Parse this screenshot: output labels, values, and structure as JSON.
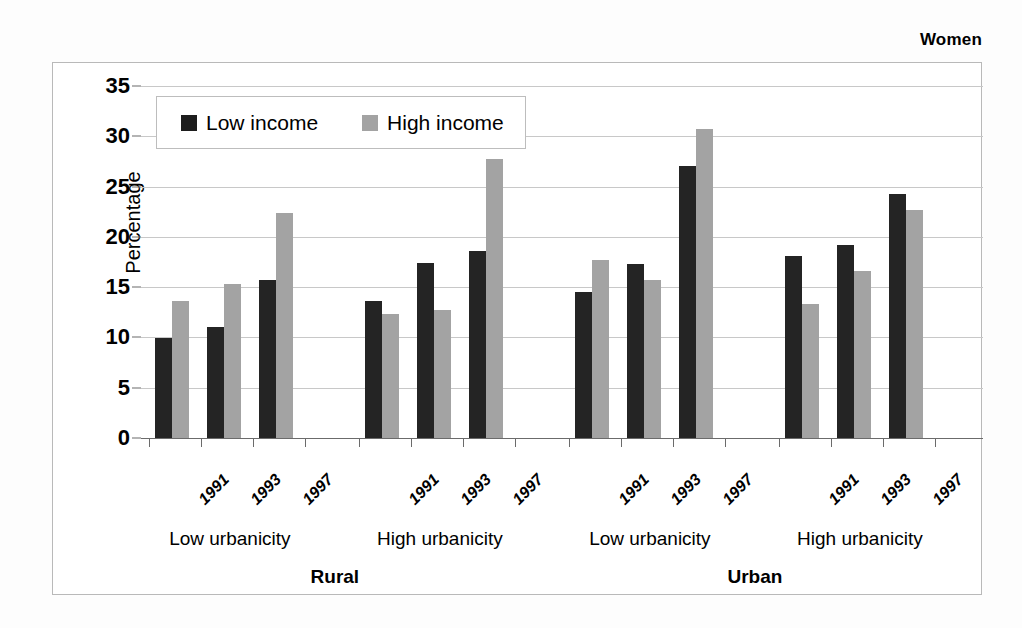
{
  "title": "Women",
  "legend": {
    "items": [
      {
        "label": "Low income",
        "key": "low",
        "color": "#1d1d1d"
      },
      {
        "label": "High income",
        "key": "high",
        "color": "#a3a3a3"
      }
    ]
  },
  "axis": {
    "y_title": "Percentage",
    "y_ticks": [
      "0",
      "5",
      "10",
      "15",
      "20",
      "25",
      "30",
      "35"
    ]
  },
  "groups": [
    {
      "region": "Rural",
      "urbanicity": "Low urbanicity",
      "years": [
        "1991",
        "1993",
        "1997"
      ]
    },
    {
      "region": "Rural",
      "urbanicity": "High urbanicity",
      "years": [
        "1991",
        "1993",
        "1997"
      ]
    },
    {
      "region": "Urban",
      "urbanicity": "Low urbanicity",
      "years": [
        "1991",
        "1993",
        "1997"
      ]
    },
    {
      "region": "Urban",
      "urbanicity": "High urbanicity",
      "years": [
        "1991",
        "1993",
        "1997"
      ]
    }
  ],
  "regions": [
    {
      "label": "Rural"
    },
    {
      "label": "Urban"
    }
  ],
  "chart_data": {
    "type": "bar",
    "title": "Women",
    "xlabel": "",
    "ylabel": "Percentage",
    "ylim": [
      0,
      35
    ],
    "ytick_step": 5,
    "grid": true,
    "legend_position": "top-left-inside",
    "group_levels": [
      "region",
      "urbanicity",
      "year"
    ],
    "categories": [
      "Rural / Low urbanicity / 1991",
      "Rural / Low urbanicity / 1993",
      "Rural / Low urbanicity / 1997",
      "Rural / High urbanicity / 1991",
      "Rural / High urbanicity / 1993",
      "Rural / High urbanicity / 1997",
      "Urban / Low urbanicity / 1991",
      "Urban / Low urbanicity / 1993",
      "Urban / Low urbanicity / 1997",
      "Urban / High urbanicity / 1991",
      "Urban / High urbanicity / 1993",
      "Urban / High urbanicity / 1997"
    ],
    "series": [
      {
        "name": "Low income",
        "color": "#1d1d1d",
        "values": [
          9.9,
          11.0,
          15.7,
          13.6,
          17.4,
          18.6,
          14.5,
          17.3,
          27.0,
          18.1,
          19.2,
          24.3
        ]
      },
      {
        "name": "High income",
        "color": "#a3a3a3",
        "values": [
          13.6,
          15.3,
          22.4,
          12.3,
          12.7,
          27.7,
          17.7,
          15.7,
          30.7,
          13.3,
          16.6,
          22.7
        ]
      }
    ]
  }
}
